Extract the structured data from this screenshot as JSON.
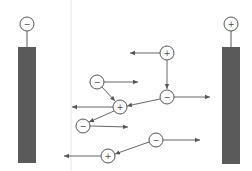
{
  "diagram": {
    "colors": {
      "electrode_fill": "#5a5a5a",
      "ion_stroke": "#555555",
      "arrow": "#555555",
      "divider": "#e6e6e6"
    },
    "electrodes": [
      {
        "id": "left-electrode",
        "sign": "−",
        "name": "cathode",
        "terminal": {
          "cx": 27,
          "cy": 24
        },
        "bar": {
          "x": 18,
          "y": 47,
          "w": 18,
          "h": 116
        }
      },
      {
        "id": "right-electrode",
        "sign": "+",
        "name": "anode",
        "terminal": {
          "cx": 231,
          "cy": 24
        },
        "bar": {
          "x": 222,
          "y": 47,
          "w": 18,
          "h": 117
        }
      }
    ],
    "ions": [
      {
        "id": "ion-1",
        "sign": "+",
        "cx": 167,
        "cy": 53
      },
      {
        "id": "ion-2",
        "sign": "−",
        "cx": 97,
        "cy": 82
      },
      {
        "id": "ion-3",
        "sign": "+",
        "cx": 120,
        "cy": 107
      },
      {
        "id": "ion-4",
        "sign": "−",
        "cx": 167,
        "cy": 97
      },
      {
        "id": "ion-5",
        "sign": "−",
        "cx": 83,
        "cy": 126
      },
      {
        "id": "ion-6",
        "sign": "−",
        "cx": 156,
        "cy": 140
      },
      {
        "id": "ion-7",
        "sign": "+",
        "cx": 108,
        "cy": 156
      }
    ],
    "motion_arrows": [
      {
        "from": "ion-1",
        "x1": 160,
        "y1": 53,
        "x2": 130,
        "y2": 53,
        "direction": "left"
      },
      {
        "from": "ion-2",
        "x1": 104,
        "y1": 82,
        "x2": 138,
        "y2": 82,
        "direction": "right"
      },
      {
        "from": "ion-3",
        "x1": 113,
        "y1": 107,
        "x2": 72,
        "y2": 107,
        "direction": "left"
      },
      {
        "from": "ion-4",
        "x1": 174,
        "y1": 97,
        "x2": 210,
        "y2": 97,
        "direction": "right"
      },
      {
        "from": "ion-5",
        "x1": 90,
        "y1": 126,
        "x2": 128,
        "y2": 127,
        "direction": "right"
      },
      {
        "from": "ion-6",
        "x1": 163,
        "y1": 140,
        "x2": 200,
        "y2": 140,
        "direction": "right"
      },
      {
        "from": "ion-7",
        "x1": 101,
        "y1": 156,
        "x2": 64,
        "y2": 156,
        "direction": "left"
      }
    ],
    "attraction_links": [
      {
        "from": "ion-1",
        "to": "ion-4",
        "x1": 167,
        "y1": 60,
        "x2": 167,
        "y2": 89,
        "arrow": true
      },
      {
        "from": "ion-2",
        "to": "ion-3",
        "x1": 102,
        "y1": 87,
        "x2": 115,
        "y2": 101,
        "arrow": true
      },
      {
        "from": "ion-3",
        "to": "ion-5",
        "x1": 114,
        "y1": 111,
        "x2": 89,
        "y2": 122,
        "arrow": true
      },
      {
        "from": "ion-4",
        "to": "ion-3",
        "x1": 160,
        "y1": 99,
        "x2": 127,
        "y2": 106,
        "arrow": true
      },
      {
        "from": "ion-6",
        "to": "ion-7",
        "x1": 149,
        "y1": 142,
        "x2": 115,
        "y2": 154,
        "arrow": true
      }
    ],
    "divider": {
      "x": 71,
      "y1": 0,
      "y2": 171
    }
  }
}
